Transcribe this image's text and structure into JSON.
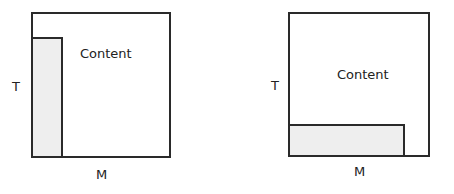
{
  "diagrams": [
    {
      "name": "vertical-menu-layout",
      "content_label": "Content",
      "t_label": "T",
      "m_label": "M",
      "menu_position": "left",
      "menu_fill": "#eeeeee"
    },
    {
      "name": "horizontal-menu-layout",
      "content_label": "Content",
      "t_label": "T",
      "m_label": "M",
      "menu_position": "bottom",
      "menu_fill": "#eeeeee"
    }
  ]
}
